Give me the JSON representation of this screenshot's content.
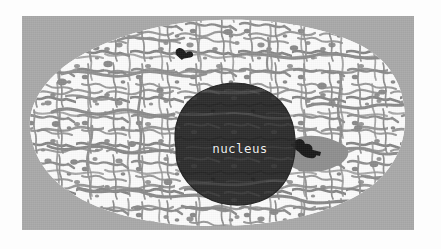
{
  "figure": {
    "kind": "electron-micrograph-illustration",
    "outer_margin_color": "#fdfdfd",
    "panel": {
      "background_color": "#a9a9a9",
      "x": 22,
      "y": 16,
      "width": 392,
      "height": 214
    }
  },
  "labels": {
    "nucleus": "nucleus"
  },
  "structures": [
    {
      "name": "cytoplasm",
      "description": "white ground substance filling the cell body",
      "color": "#fbfbfb"
    },
    {
      "name": "reticular-network",
      "description": "gray mottled endoplasmic-reticulum-like strands throughout the cytoplasm",
      "color": "#8d8d8d"
    },
    {
      "name": "nucleus",
      "description": "large dark rounded organelle near the center of the cell",
      "color": "#2e2e2e",
      "label": "nucleus"
    },
    {
      "name": "dark-organelle-upper",
      "description": "small near-black organelle in upper cytoplasm",
      "color": "#1a1a1a"
    },
    {
      "name": "dark-organelle-right",
      "description": "small near-black organelle within a gray patch right of the nucleus",
      "color": "#1a1a1a"
    }
  ],
  "colors": {
    "background_gray": "#a9a9a9",
    "cytoplasm_white": "#fbfbfb",
    "reticulum_gray": "#8d8d8d",
    "nucleus_dark": "#2e2e2e",
    "organelle_black": "#1a1a1a",
    "label_text": "#f2f2f2",
    "page_white": "#fdfdfd"
  }
}
